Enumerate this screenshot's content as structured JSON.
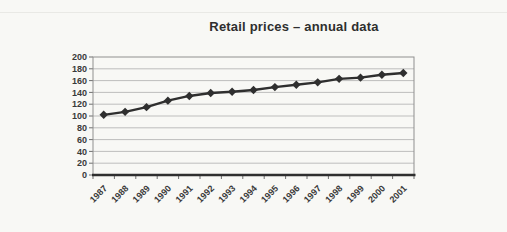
{
  "chart_data": {
    "type": "line",
    "title": "Retail prices – annual data",
    "categories": [
      "1987",
      "1988",
      "1989",
      "1990",
      "1991",
      "1992",
      "1993",
      "1994",
      "1995",
      "1996",
      "1997",
      "1998",
      "1999",
      "2000",
      "2001"
    ],
    "values": [
      102,
      107,
      115,
      126,
      134,
      139,
      141,
      144,
      149,
      153,
      157,
      163,
      165,
      170,
      173
    ],
    "xlabel": "",
    "ylabel": "",
    "ylim": [
      0,
      200
    ],
    "ytick_step": 20,
    "grid": true,
    "legend_position": "none",
    "marker": "diamond",
    "colors": {
      "line": "#2f2f2f",
      "marker": "#2f2f2f",
      "grid": "#aeaeae",
      "plot_border": "#8f8f8f",
      "axis": "#2f2f2f",
      "text": "#3a3a3a",
      "background": "#f8f8f5"
    }
  }
}
